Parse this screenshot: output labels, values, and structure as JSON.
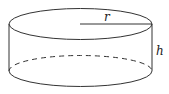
{
  "diagram": {
    "shape": "cylinder",
    "labels": {
      "radius": "r",
      "height": "h"
    },
    "colors": {
      "stroke": "#333333",
      "background": "#ffffff"
    }
  }
}
